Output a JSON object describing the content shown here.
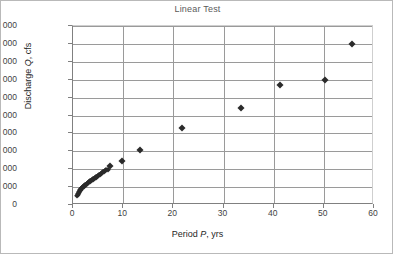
{
  "chart_data": {
    "type": "scatter",
    "title": "Linear Test",
    "xlabel": "Period P, yrs",
    "xlabel_parts": {
      "pre": "Period ",
      "italic": "P",
      "post": ", yrs"
    },
    "ylabel": "Discharge Q, cfs",
    "ylabel_parts": {
      "pre": "Discharge ",
      "italic": "Q",
      "post": ", cfs"
    },
    "xlim": [
      0,
      60
    ],
    "ylim": [
      0,
      50000
    ],
    "xticks": [
      0,
      10,
      20,
      30,
      40,
      50,
      60
    ],
    "xtick_labels": [
      "0",
      "10",
      "20",
      "30",
      "40",
      "50",
      "60"
    ],
    "yticks": [
      0,
      5000,
      10000,
      15000,
      20000,
      25000,
      30000,
      35000,
      40000,
      45000,
      50000
    ],
    "ytick_labels": [
      "0",
      "5 000",
      "10 000",
      "15 000",
      "20 000",
      "25 000",
      "30 000",
      "35 000",
      "40 000",
      "45 000",
      "50 000"
    ],
    "grid": {
      "horizontal": true,
      "vertical": true
    },
    "legend": null,
    "marker": {
      "shape": "diamond",
      "color": "#2b2b2b",
      "size": 5
    },
    "series": [
      {
        "name": "Discharge vs Period",
        "points": [
          [
            0.85,
            2500
          ],
          [
            0.95,
            2900
          ],
          [
            1.05,
            3200
          ],
          [
            1.15,
            3450
          ],
          [
            1.25,
            3700
          ],
          [
            1.35,
            3900
          ],
          [
            1.45,
            4100
          ],
          [
            1.55,
            4300
          ],
          [
            1.65,
            4500
          ],
          [
            1.75,
            4650
          ],
          [
            1.85,
            4800
          ],
          [
            1.95,
            4950
          ],
          [
            2.1,
            5150
          ],
          [
            2.25,
            5350
          ],
          [
            2.4,
            5500
          ],
          [
            2.55,
            5700
          ],
          [
            2.7,
            5850
          ],
          [
            2.85,
            6000
          ],
          [
            3.0,
            6150
          ],
          [
            3.15,
            6300
          ],
          [
            3.3,
            6450
          ],
          [
            3.45,
            6600
          ],
          [
            3.6,
            6750
          ],
          [
            3.75,
            6900
          ],
          [
            3.9,
            7050
          ],
          [
            4.05,
            7200
          ],
          [
            4.2,
            7350
          ],
          [
            4.35,
            7500
          ],
          [
            4.5,
            7650
          ],
          [
            4.65,
            7800
          ],
          [
            4.8,
            7950
          ],
          [
            4.95,
            8100
          ],
          [
            5.1,
            8300
          ],
          [
            5.3,
            8500
          ],
          [
            5.5,
            8700
          ],
          [
            5.7,
            8900
          ],
          [
            5.9,
            9100
          ],
          [
            6.1,
            9300
          ],
          [
            6.3,
            9500
          ],
          [
            6.5,
            9650
          ],
          [
            6.9,
            9700
          ],
          [
            7.4,
            11000
          ],
          [
            9.7,
            12300
          ],
          [
            13.3,
            15500
          ],
          [
            21.7,
            21400
          ],
          [
            33.5,
            27100
          ],
          [
            41.3,
            33500
          ],
          [
            50.3,
            35000
          ],
          [
            55.7,
            45000
          ]
        ]
      }
    ]
  }
}
